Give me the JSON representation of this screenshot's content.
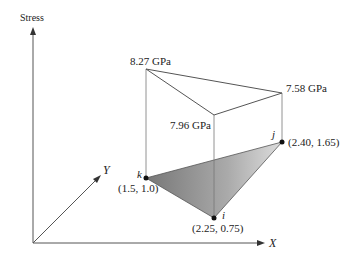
{
  "axes": {
    "stress": "Stress",
    "x": "X",
    "y": "Y"
  },
  "nodes": [
    {
      "id": "k",
      "coord": "(1.5, 1.0)",
      "stress": "8.27 GPa"
    },
    {
      "id": "i",
      "coord": "(2.25, 0.75)",
      "stress": "7.96 GPa"
    },
    {
      "id": "j",
      "coord": "(2.40, 1.65)",
      "stress": "7.58 GPa"
    }
  ],
  "colors": {
    "line": "#555555",
    "fill_light": "#d8d8d8",
    "fill_dark": "#777777"
  }
}
